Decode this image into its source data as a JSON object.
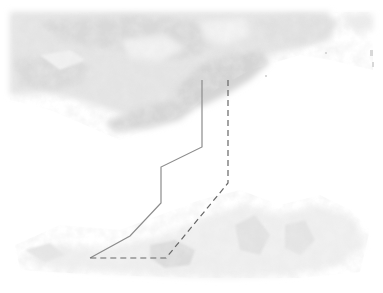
{
  "image": {
    "type": "satellite-cloud-imagery",
    "colors": {
      "background": "#ffffff",
      "cloud_dark": "#d4d4d4",
      "cloud_mid": "#e2e2e2",
      "cloud_light": "#efefef",
      "solid_track": "#8c8c8c",
      "dashed_track": "#666666"
    }
  },
  "overlays": {
    "solid_track": {
      "style": "solid",
      "points": [
        [
          202,
          80
        ],
        [
          202,
          147
        ],
        [
          161,
          167
        ],
        [
          161,
          203
        ],
        [
          130,
          236
        ],
        [
          90,
          258
        ]
      ]
    },
    "dashed_track": {
      "style": "dashed",
      "points": [
        [
          228,
          80
        ],
        [
          228,
          183
        ],
        [
          166,
          258
        ],
        [
          90,
          258
        ]
      ]
    }
  }
}
